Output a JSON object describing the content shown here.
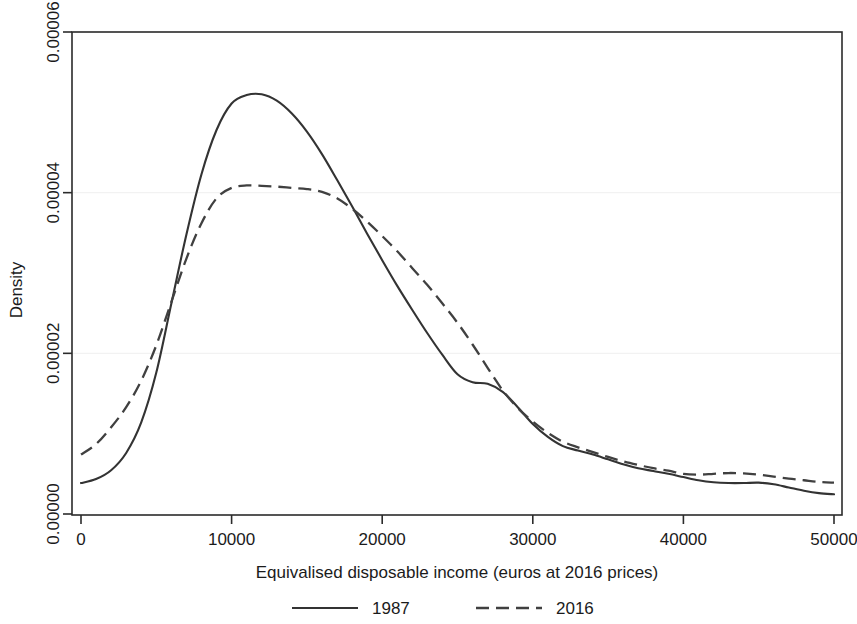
{
  "chart_data": {
    "type": "line",
    "title": "",
    "xlabel": "Equivalised disposable income (euros at 2016 prices)",
    "ylabel": "Density",
    "xlim": [
      0,
      50000
    ],
    "ylim": [
      0.0,
      6e-05
    ],
    "xticks": [
      0,
      10000,
      20000,
      30000,
      40000,
      50000
    ],
    "xtick_labels": [
      "0",
      "10000",
      "20000",
      "30000",
      "40000",
      "50000"
    ],
    "yticks": [
      0.0,
      2e-05,
      4e-05,
      6e-05
    ],
    "ytick_labels": [
      "0.00000",
      "0.00002",
      "0.00004",
      "0.00006"
    ],
    "grid": false,
    "legend_position": "below-axis",
    "series": [
      {
        "name": "1987",
        "style": "solid",
        "color": "#333333",
        "x": [
          0,
          1000,
          2000,
          3000,
          4000,
          5000,
          6000,
          7000,
          8000,
          9000,
          10000,
          11000,
          12000,
          13000,
          14000,
          15000,
          16000,
          17000,
          18000,
          19000,
          20000,
          21000,
          22000,
          23000,
          24000,
          25000,
          26000,
          27000,
          28000,
          29000,
          30000,
          31000,
          32000,
          33000,
          34000,
          35000,
          36000,
          37000,
          38000,
          39000,
          40000,
          41000,
          42000,
          43000,
          44000,
          45000,
          46000,
          47000,
          48000,
          49000,
          50000
        ],
        "y": [
          3.85e-06,
          4.35e-06,
          5.45e-06,
          7.6e-06,
          1.14e-05,
          1.76e-05,
          2.62e-05,
          3.48e-05,
          4.23e-05,
          4.78e-05,
          5.11e-05,
          5.215e-05,
          5.225e-05,
          5.145e-05,
          4.985e-05,
          4.76e-05,
          4.48e-05,
          4.16e-05,
          3.83e-05,
          3.49e-05,
          3.16e-05,
          2.84e-05,
          2.54e-05,
          2.25e-05,
          1.98e-05,
          1.74e-05,
          1.64e-05,
          1.62e-05,
          1.52e-05,
          1.33e-05,
          1.12e-05,
          9.6e-06,
          8.45e-06,
          7.9e-06,
          7.4e-06,
          6.8e-06,
          6.2e-06,
          5.7e-06,
          5.35e-06,
          5e-06,
          4.6e-06,
          4.2e-06,
          3.95e-06,
          3.85e-06,
          3.85e-06,
          3.9e-06,
          3.7e-06,
          3.3e-06,
          2.9e-06,
          2.6e-06,
          2.45e-06
        ]
      },
      {
        "name": "2016",
        "style": "dashed",
        "color": "#404040",
        "x": [
          0,
          1000,
          2000,
          3000,
          4000,
          5000,
          6000,
          7000,
          8000,
          9000,
          10000,
          11000,
          12000,
          13000,
          14000,
          15000,
          16000,
          17000,
          18000,
          19000,
          20000,
          21000,
          22000,
          23000,
          24000,
          25000,
          26000,
          27000,
          28000,
          29000,
          30000,
          31000,
          32000,
          33000,
          34000,
          35000,
          36000,
          37000,
          38000,
          39000,
          40000,
          41000,
          42000,
          43000,
          44000,
          45000,
          46000,
          47000,
          48000,
          49000,
          50000
        ],
        "y": [
          7.4e-06,
          8.7e-06,
          1.08e-05,
          1.33e-05,
          1.66e-05,
          2.1e-05,
          2.64e-05,
          3.18e-05,
          3.62e-05,
          3.93e-05,
          4.06e-05,
          4.09e-05,
          4.085e-05,
          4.075e-05,
          4.06e-05,
          4.045e-05,
          4.01e-05,
          3.93e-05,
          3.8e-05,
          3.64e-05,
          3.46e-05,
          3.27e-05,
          3.06e-05,
          2.85e-05,
          2.62e-05,
          2.38e-05,
          2.11e-05,
          1.82e-05,
          1.54e-05,
          1.32e-05,
          1.15e-05,
          1.01e-05,
          9e-06,
          8.3e-06,
          7.7e-06,
          7.1e-06,
          6.55e-06,
          6.1e-06,
          5.7e-06,
          5.4e-06,
          5e-06,
          4.9e-06,
          5e-06,
          5.1e-06,
          5.05e-06,
          4.9e-06,
          4.65e-06,
          4.4e-06,
          4.2e-06,
          4e-06,
          3.9e-06
        ]
      }
    ],
    "legend": [
      {
        "label": "1987",
        "style": "solid"
      },
      {
        "label": "2016",
        "style": "dashed"
      }
    ]
  }
}
